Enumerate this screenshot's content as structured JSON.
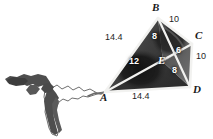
{
  "figure": {
    "vertices": [
      {
        "id": "A",
        "label": "A",
        "x": 105,
        "y": 92,
        "label_x": 100,
        "label_y": 94,
        "on_dark": false
      },
      {
        "id": "B",
        "label": "B",
        "x": 158,
        "y": 18,
        "label_x": 152,
        "label_y": 2,
        "on_dark": false
      },
      {
        "id": "C",
        "label": "C",
        "x": 192,
        "y": 44,
        "label_x": 195,
        "label_y": 31,
        "on_dark": false
      },
      {
        "id": "D",
        "label": "D",
        "x": 190,
        "y": 87,
        "label_x": 193,
        "label_y": 86,
        "on_dark": false
      },
      {
        "id": "E",
        "label": "E",
        "x": 163,
        "y": 62,
        "label_x": 159,
        "label_y": 57,
        "on_dark": true
      }
    ],
    "edges": [
      {
        "id": "AB",
        "from": "A",
        "to": "B",
        "length": "14.4",
        "label_x": 106,
        "label_y": 34,
        "inner": false
      },
      {
        "id": "BC",
        "from": "B",
        "to": "C",
        "length": "10",
        "label_x": 170,
        "label_y": 17,
        "inner": false
      },
      {
        "id": "CD",
        "from": "C",
        "to": "D",
        "length": "10",
        "label_x": 196,
        "label_y": 53,
        "inner": false
      },
      {
        "id": "AD",
        "from": "A",
        "to": "D",
        "length": "14.4",
        "label_x": 133,
        "label_y": 93,
        "inner": false
      }
    ],
    "diagonals": [
      {
        "id": "AC",
        "from": "A",
        "to": "C",
        "segments": [
          {
            "id": "AE",
            "length": "12",
            "label_x": 129,
            "label_y": 59,
            "inner": true
          },
          {
            "id": "EC",
            "length": "6",
            "label_x": 176,
            "label_y": 47,
            "inner": true
          }
        ]
      },
      {
        "id": "BD",
        "from": "B",
        "to": "D",
        "segments": [
          {
            "id": "BE",
            "length": "8",
            "label_x": 152,
            "label_y": 33,
            "inner": true
          },
          {
            "id": "ED",
            "length": "8",
            "label_x": 172,
            "label_y": 68,
            "inner": true
          }
        ]
      }
    ],
    "colors": {
      "stroke": "#f2f2f0",
      "fill_dark": "#3a3a3a",
      "fill_mid": "#555555",
      "silhouette": "#4a4a4a",
      "background": "#ffffff",
      "text_dark": "#1a1a1a",
      "text_light": "#ffffff"
    }
  }
}
